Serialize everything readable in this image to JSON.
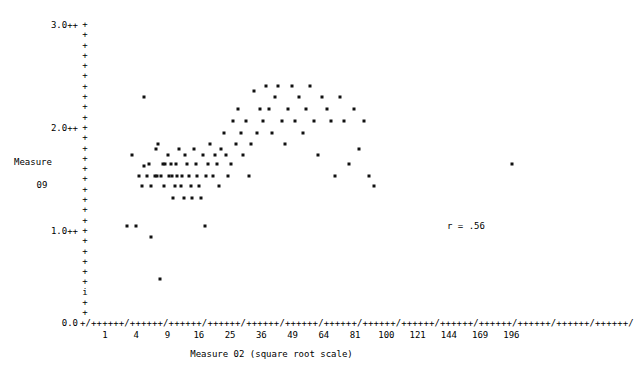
{
  "chart_data": {
    "type": "scatter",
    "title": "",
    "xlabel": "Measure 02 (square root scale)",
    "ylabel": "Measure 09",
    "ylabel_lines": [
      "Measure",
      "09"
    ],
    "annotation": "r = .56",
    "correlation": 0.56,
    "grid": false,
    "legend": null,
    "axis_style": "ascii-plus-slash",
    "x_scale": "square-root",
    "xlim": [
      0,
      210
    ],
    "ylim": [
      0.0,
      3.1
    ],
    "x_tick_labels": [
      "1",
      "4",
      "9",
      "16",
      "25",
      "36",
      "49",
      "64",
      "81",
      "100",
      "121",
      "144",
      "169",
      "196"
    ],
    "x_tick_values": [
      1,
      4,
      9,
      16,
      25,
      36,
      49,
      64,
      81,
      100,
      121,
      144,
      169,
      196
    ],
    "y_tick_labels": [
      "3.0++",
      "2.0++",
      "1.0++",
      "0.0"
    ],
    "y_tick_values": [
      3.0,
      2.0,
      1.0,
      0.0
    ],
    "marker": "*",
    "marker_color": "#111111",
    "points": [
      [
        2.3,
        0.98
      ],
      [
        2.8,
        1.72
      ],
      [
        3.2,
        0.98
      ],
      [
        3.6,
        1.5
      ],
      [
        4.0,
        1.39
      ],
      [
        4.2,
        1.6
      ],
      [
        4.3,
        2.32
      ],
      [
        4.6,
        1.5
      ],
      [
        4.9,
        1.62
      ],
      [
        5.2,
        0.86
      ],
      [
        5.3,
        1.39
      ],
      [
        5.8,
        1.5
      ],
      [
        6.0,
        1.78
      ],
      [
        6.2,
        1.5
      ],
      [
        6.4,
        1.83
      ],
      [
        6.6,
        0.43
      ],
      [
        6.9,
        1.5
      ],
      [
        7.2,
        1.62
      ],
      [
        7.4,
        1.39
      ],
      [
        7.6,
        1.62
      ],
      [
        8.1,
        1.72
      ],
      [
        8.3,
        1.5
      ],
      [
        8.6,
        1.62
      ],
      [
        8.8,
        1.5
      ],
      [
        9.0,
        1.27
      ],
      [
        9.4,
        1.39
      ],
      [
        9.6,
        1.62
      ],
      [
        9.9,
        1.5
      ],
      [
        10.2,
        1.78
      ],
      [
        10.6,
        1.39
      ],
      [
        10.9,
        1.5
      ],
      [
        11.3,
        1.27
      ],
      [
        11.6,
        1.72
      ],
      [
        12.0,
        1.62
      ],
      [
        12.4,
        1.5
      ],
      [
        12.9,
        1.39
      ],
      [
        13.2,
        1.27
      ],
      [
        13.6,
        1.78
      ],
      [
        14.0,
        1.62
      ],
      [
        14.4,
        1.5
      ],
      [
        14.8,
        1.39
      ],
      [
        15.3,
        1.27
      ],
      [
        15.8,
        1.72
      ],
      [
        16.2,
        0.98
      ],
      [
        16.6,
        1.5
      ],
      [
        17.2,
        1.62
      ],
      [
        17.8,
        1.83
      ],
      [
        18.4,
        1.5
      ],
      [
        19.0,
        1.72
      ],
      [
        19.6,
        1.62
      ],
      [
        20.2,
        1.39
      ],
      [
        20.9,
        1.78
      ],
      [
        21.6,
        1.95
      ],
      [
        22.3,
        1.72
      ],
      [
        23.0,
        1.5
      ],
      [
        23.8,
        1.62
      ],
      [
        24.6,
        2.07
      ],
      [
        25.4,
        1.83
      ],
      [
        26.2,
        2.2
      ],
      [
        27.0,
        1.95
      ],
      [
        27.9,
        1.72
      ],
      [
        28.8,
        2.07
      ],
      [
        29.8,
        1.5
      ],
      [
        30.7,
        1.83
      ],
      [
        31.8,
        2.38
      ],
      [
        32.8,
        1.95
      ],
      [
        33.9,
        2.2
      ],
      [
        35.0,
        2.07
      ],
      [
        36.2,
        2.44
      ],
      [
        37.4,
        2.2
      ],
      [
        38.6,
        1.95
      ],
      [
        39.9,
        2.32
      ],
      [
        41.2,
        2.44
      ],
      [
        42.6,
        2.07
      ],
      [
        44.0,
        1.83
      ],
      [
        45.5,
        2.2
      ],
      [
        47.0,
        2.44
      ],
      [
        48.6,
        2.07
      ],
      [
        50.2,
        2.32
      ],
      [
        52.0,
        1.95
      ],
      [
        53.8,
        2.2
      ],
      [
        55.6,
        2.44
      ],
      [
        57.5,
        2.07
      ],
      [
        59.5,
        1.72
      ],
      [
        61.6,
        2.32
      ],
      [
        63.8,
        2.2
      ],
      [
        66.0,
        2.07
      ],
      [
        68.4,
        1.5
      ],
      [
        70.8,
        2.32
      ],
      [
        73.4,
        2.07
      ],
      [
        76.0,
        1.62
      ],
      [
        78.8,
        2.2
      ],
      [
        81.6,
        1.78
      ],
      [
        84.6,
        2.07
      ],
      [
        87.7,
        1.5
      ],
      [
        91.0,
        1.39
      ],
      [
        196.0,
        1.62
      ]
    ]
  }
}
